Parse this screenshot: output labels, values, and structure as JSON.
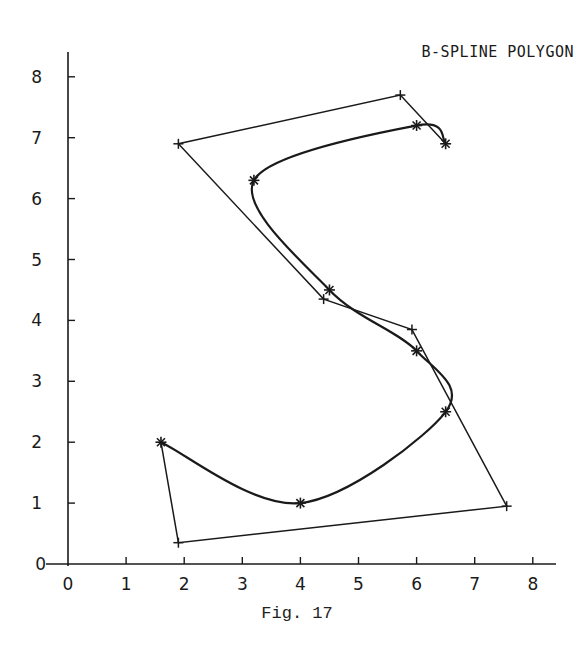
{
  "caption": "Fig. 17",
  "chart_data": {
    "type": "line",
    "title": "B-SPLINE POLYGON",
    "xlabel": "",
    "ylabel": "",
    "xlim": [
      0,
      8
    ],
    "ylim": [
      0,
      8
    ],
    "x_ticks": [
      "0",
      "1",
      "2",
      "3",
      "4",
      "5",
      "6",
      "7",
      "8"
    ],
    "y_ticks": [
      "0",
      "1",
      "2",
      "3",
      "4",
      "5",
      "6",
      "7",
      "8"
    ],
    "grid": false,
    "legend": null,
    "series": [
      {
        "name": "control polygon",
        "marker": "+",
        "points": [
          [
            1.6,
            2.0
          ],
          [
            1.9,
            0.35
          ],
          [
            7.55,
            0.95
          ],
          [
            5.92,
            3.85
          ],
          [
            4.4,
            4.35
          ],
          [
            1.9,
            6.9
          ],
          [
            5.72,
            7.7
          ],
          [
            6.5,
            6.9
          ]
        ]
      },
      {
        "name": "B-spline curve",
        "marker": "*",
        "points": [
          [
            1.6,
            2.0
          ],
          [
            4.0,
            1.0
          ],
          [
            6.5,
            2.5
          ],
          [
            6.0,
            3.5
          ],
          [
            4.5,
            4.5
          ],
          [
            3.2,
            6.3
          ],
          [
            6.0,
            7.2
          ],
          [
            6.5,
            6.9
          ]
        ]
      }
    ]
  },
  "colors": {
    "ink": "#1a1a1a",
    "background": "#ffffff"
  }
}
